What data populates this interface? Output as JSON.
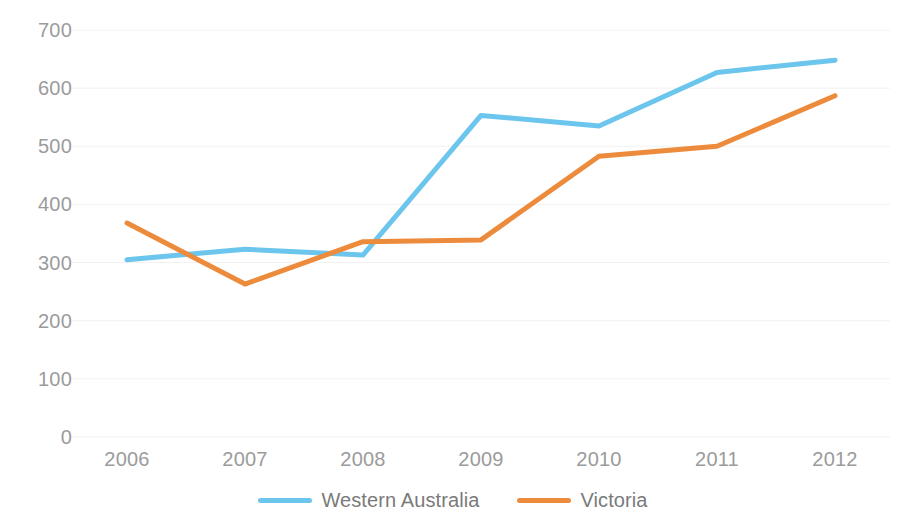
{
  "chart_data": {
    "type": "line",
    "title": "",
    "subtitle": "",
    "xlabel": "",
    "ylabel": "",
    "categories": [
      "2006",
      "2007",
      "2008",
      "2009",
      "2010",
      "2011",
      "2012"
    ],
    "series": [
      {
        "name": "Western Australia",
        "color": "#6CC5EC",
        "values": [
          305,
          323,
          313,
          553,
          535,
          627,
          648
        ]
      },
      {
        "name": "Victoria",
        "color": "#ED8B3C",
        "values": [
          368,
          263,
          336,
          339,
          483,
          500,
          587
        ]
      }
    ],
    "ylim": [
      0,
      700
    ],
    "yticks": [
      0,
      100,
      200,
      300,
      400,
      500,
      600,
      700
    ],
    "ytick_labels": [
      "0",
      "100",
      "200",
      "300",
      "400",
      "500",
      "600",
      "700"
    ],
    "xtick_labels": [
      "2006",
      "2007",
      "2008",
      "2009",
      "2010",
      "2011",
      "2012"
    ],
    "grid": true,
    "grid_color": "#f2f2f2",
    "legend_position": "bottom",
    "legend_entries": [
      "Western Australia",
      "Victoria"
    ],
    "background_color": "#FFFFFF",
    "tick_label_color": "#9B9B9B"
  }
}
